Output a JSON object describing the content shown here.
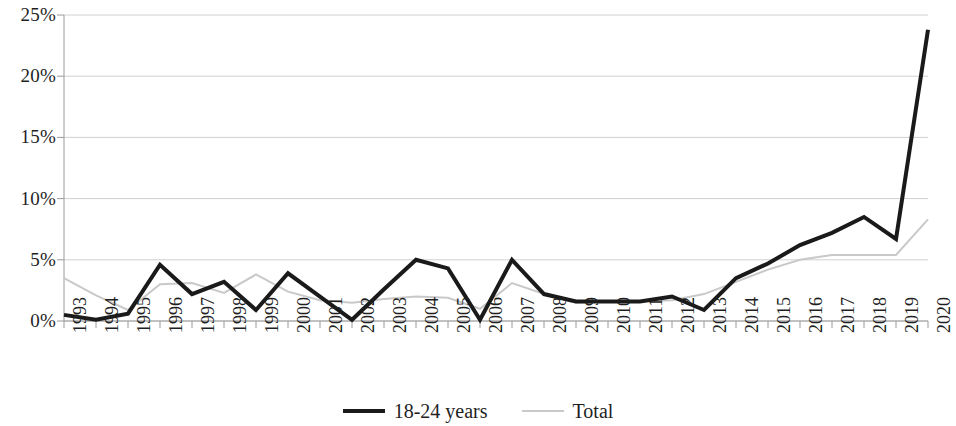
{
  "chart_data": {
    "type": "line",
    "title": "",
    "subtitle": "",
    "xlabel": "",
    "ylabel": "",
    "grid": true,
    "legend_position": "bottom",
    "xlim": [
      1993,
      2020
    ],
    "ylim": [
      0,
      25
    ],
    "y_ticks": [
      0,
      5,
      10,
      15,
      20,
      25
    ],
    "y_tick_labels": [
      "0%",
      "5%",
      "10%",
      "15%",
      "20%",
      "25%"
    ],
    "x": [
      1993,
      1994,
      1995,
      1996,
      1997,
      1998,
      1999,
      2000,
      2001,
      2002,
      2003,
      2004,
      2005,
      2006,
      2007,
      2008,
      2009,
      2010,
      2011,
      2012,
      2013,
      2014,
      2015,
      2016,
      2017,
      2018,
      2019,
      2020
    ],
    "x_tick_labels": [
      "1993",
      "1994",
      "1995",
      "1996",
      "1997",
      "1998",
      "1999",
      "2000",
      "2001",
      "2002",
      "2003",
      "2004",
      "2005",
      "2006",
      "2007",
      "2008",
      "2009",
      "2010",
      "2011",
      "2012",
      "2013",
      "2014",
      "2015",
      "2016",
      "2017",
      "2018",
      "2019",
      "2020"
    ],
    "series": [
      {
        "name": "18-24 years",
        "color": "#1a1a1a",
        "width": 4,
        "values": [
          0.5,
          0.1,
          0.6,
          4.6,
          2.2,
          3.2,
          0.9,
          3.9,
          2.0,
          0.1,
          2.6,
          5.0,
          4.3,
          0.1,
          5.0,
          2.2,
          1.6,
          1.6,
          1.6,
          2.0,
          0.9,
          3.5,
          4.7,
          6.2,
          7.2,
          8.5,
          6.7,
          23.8
        ]
      },
      {
        "name": "Total",
        "color": "#c9c9c9",
        "width": 2,
        "values": [
          3.5,
          2.1,
          0.9,
          3.0,
          3.1,
          2.3,
          3.8,
          2.4,
          1.7,
          1.5,
          1.8,
          2.0,
          1.9,
          1.0,
          3.1,
          2.2,
          1.5,
          1.6,
          1.6,
          1.7,
          2.2,
          3.2,
          4.2,
          5.0,
          5.4,
          5.4,
          5.4,
          8.3
        ]
      }
    ]
  },
  "legend": {
    "items": [
      {
        "label": "18-24 years",
        "style": "series-primary"
      },
      {
        "label": "Total",
        "style": "series-secondary"
      }
    ]
  },
  "colors": {
    "primary_series": "#1a1a1a",
    "secondary_series": "#c9c9c9",
    "gridline": "#d0d0d0",
    "axis": "#9a9a9a",
    "text": "#1f1f1f",
    "background": "#ffffff"
  }
}
